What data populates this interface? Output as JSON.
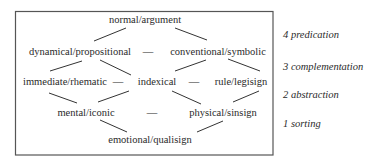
{
  "diagram": {
    "nodes": {
      "normal_argument": "normal/argument",
      "dynamical_propositional": "dynamical/propositional",
      "conventional_symbolic": "conventional/symbolic",
      "immediate_rhematic": "immediate/rhematic",
      "indexical": "indexical",
      "rule_legisign": "rule/legisign",
      "mental_iconic": "mental/iconic",
      "physical_sinsign": "physical/sinsign",
      "emotional_qualisign": "emotional/qualisign"
    },
    "dash": "—",
    "levels": [
      {
        "label": "4 predication"
      },
      {
        "label": "3 complementation"
      },
      {
        "label": "2 abstraction"
      },
      {
        "label": "1 sorting"
      }
    ],
    "edges": [
      [
        "normal/argument",
        "dynamical/propositional"
      ],
      [
        "normal/argument",
        "conventional/symbolic"
      ],
      [
        "dynamical/propositional",
        "conventional/symbolic"
      ],
      [
        "dynamical/propositional",
        "immediate/rhematic"
      ],
      [
        "dynamical/propositional",
        "indexical"
      ],
      [
        "conventional/symbolic",
        "indexical"
      ],
      [
        "conventional/symbolic",
        "rule/legisign"
      ],
      [
        "immediate/rhematic",
        "indexical"
      ],
      [
        "indexical",
        "rule/legisign"
      ],
      [
        "immediate/rhematic",
        "mental/iconic"
      ],
      [
        "indexical",
        "mental/iconic"
      ],
      [
        "indexical",
        "physical/sinsign"
      ],
      [
        "rule/legisign",
        "physical/sinsign"
      ],
      [
        "mental/iconic",
        "physical/sinsign"
      ],
      [
        "mental/iconic",
        "emotional/qualisign"
      ],
      [
        "physical/sinsign",
        "emotional/qualisign"
      ]
    ]
  }
}
